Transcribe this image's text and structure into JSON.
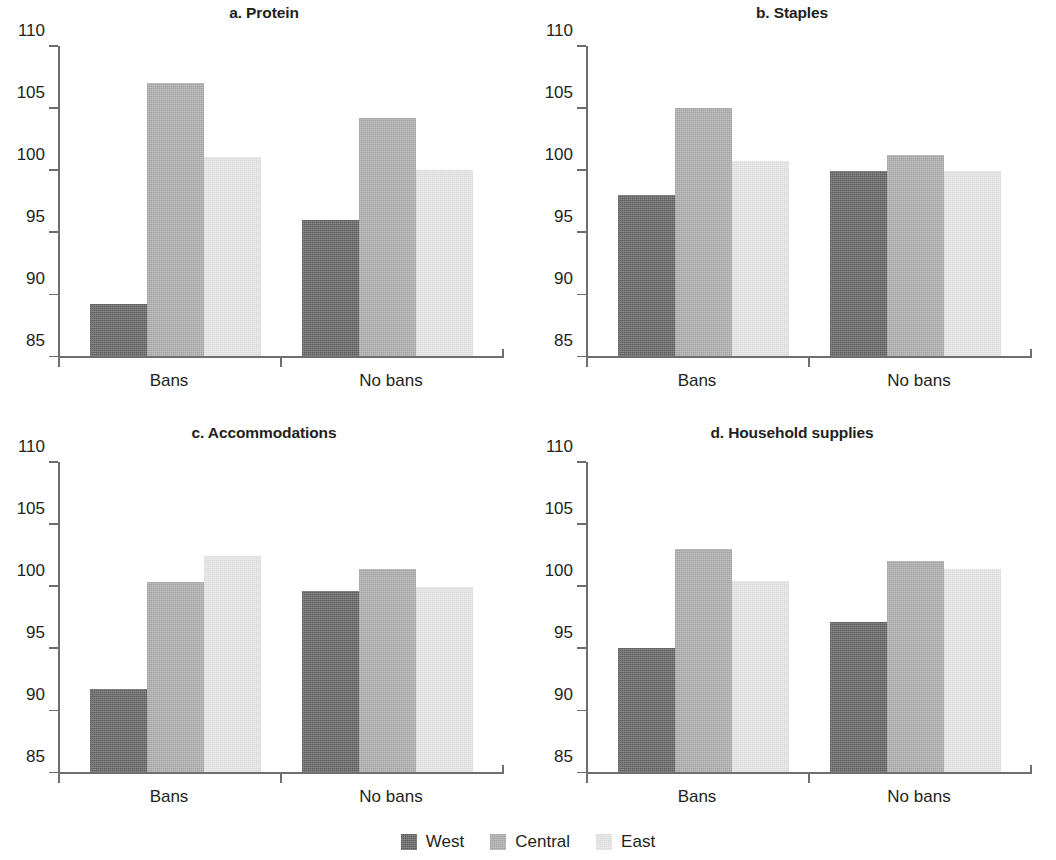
{
  "chart_data": [
    {
      "type": "bar",
      "title": "a. Protein",
      "xlabel": "",
      "ylabel": "",
      "categories": [
        "Bans",
        "No bans"
      ],
      "series": [
        {
          "name": "West",
          "values": [
            89.2,
            96.0
          ]
        },
        {
          "name": "Central",
          "values": [
            107.0,
            104.2
          ]
        },
        {
          "name": "East",
          "values": [
            101.1,
            100.0
          ]
        }
      ],
      "ylim": [
        85,
        110
      ],
      "yticks": [
        85,
        90,
        95,
        100,
        105,
        110
      ],
      "grid": false,
      "legend_position": "bottom"
    },
    {
      "type": "bar",
      "title": "b. Staples",
      "xlabel": "",
      "ylabel": "",
      "categories": [
        "Bans",
        "No bans"
      ],
      "series": [
        {
          "name": "West",
          "values": [
            98.0,
            99.9
          ]
        },
        {
          "name": "Central",
          "values": [
            105.0,
            101.2
          ]
        },
        {
          "name": "East",
          "values": [
            100.7,
            99.9
          ]
        }
      ],
      "ylim": [
        85,
        110
      ],
      "yticks": [
        85,
        90,
        95,
        100,
        105,
        110
      ],
      "grid": false,
      "legend_position": "bottom"
    },
    {
      "type": "bar",
      "title": "c. Accommodations",
      "xlabel": "",
      "ylabel": "",
      "categories": [
        "Bans",
        "No bans"
      ],
      "series": [
        {
          "name": "West",
          "values": [
            91.7,
            99.6
          ]
        },
        {
          "name": "Central",
          "values": [
            100.3,
            101.4
          ]
        },
        {
          "name": "East",
          "values": [
            102.4,
            99.9
          ]
        }
      ],
      "ylim": [
        85,
        110
      ],
      "yticks": [
        85,
        90,
        95,
        100,
        105,
        110
      ],
      "grid": false,
      "legend_position": "bottom"
    },
    {
      "type": "bar",
      "title": "d. Household supplies",
      "xlabel": "",
      "ylabel": "",
      "categories": [
        "Bans",
        "No bans"
      ],
      "series": [
        {
          "name": "West",
          "values": [
            95.0,
            97.1
          ]
        },
        {
          "name": "Central",
          "values": [
            103.0,
            102.0
          ]
        },
        {
          "name": "East",
          "values": [
            100.4,
            101.4
          ]
        }
      ],
      "ylim": [
        85,
        110
      ],
      "yticks": [
        85,
        90,
        95,
        100,
        105,
        110
      ],
      "grid": false,
      "legend_position": "bottom"
    }
  ],
  "panels": [
    {
      "title": "a. Protein"
    },
    {
      "title": "b. Staples"
    },
    {
      "title": "c. Accommodations"
    },
    {
      "title": "d. Household supplies"
    }
  ],
  "axis": {
    "ytick_labels": [
      "110",
      "105",
      "100",
      "95",
      "90",
      "85"
    ],
    "category_labels": [
      "Bans",
      "No bans"
    ]
  },
  "legend": {
    "items": [
      {
        "label": "West",
        "color": "#5e5e5e"
      },
      {
        "label": "Central",
        "color": "#a8a8a8"
      },
      {
        "label": "East",
        "color": "#e3e3e3"
      }
    ]
  },
  "colors": {
    "west": "#5e5e5e",
    "central": "#a8a8a8",
    "east": "#e3e3e3",
    "axis": "#6d6e71",
    "text": "#231f20",
    "background": "#ffffff"
  }
}
